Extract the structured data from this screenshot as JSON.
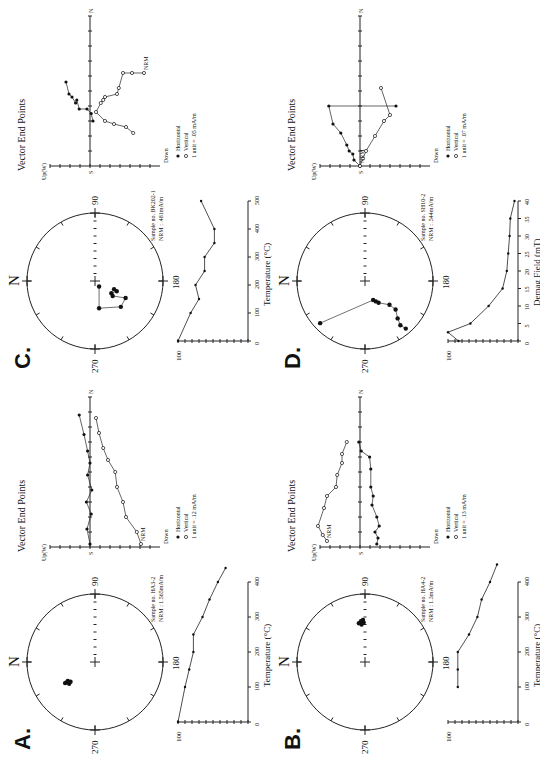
{
  "figure": {
    "orientation": "rotated 90 degrees counter-clockwise",
    "panels": [
      {
        "id": "A",
        "label": "A.",
        "stereonet": {
          "north_label": "N",
          "ticks": [
            "90",
            "180",
            "270"
          ],
          "sample_line1": "Sample no. HA3-2",
          "sample_line2": "NRM : 1.565mA/m",
          "points": [
            [
              -0.3,
              -0.42
            ],
            [
              -0.28,
              -0.4
            ],
            [
              -0.32,
              -0.38
            ],
            [
              -0.29,
              -0.36
            ],
            [
              -0.31,
              -0.44
            ]
          ]
        },
        "zijderveld": {
          "title": "Vector End Points",
          "up_label": "Up(W)",
          "down_label": "Down",
          "s_label": "S",
          "n_label": "N",
          "nrm_label": "NRM",
          "legend_horizontal": "Horizontal",
          "legend_vertical": "Vertical",
          "legend_unit": "1 unit =   .12 mA/m",
          "horizontal": [
            [
              0,
              0.02
            ],
            [
              -0.05,
              0.12
            ],
            [
              0.02,
              0.22
            ],
            [
              -0.06,
              0.3
            ],
            [
              0.03,
              0.38
            ],
            [
              -0.04,
              0.48
            ],
            [
              0,
              0.56
            ],
            [
              -0.04,
              0.64
            ],
            [
              -0.1,
              0.75
            ],
            [
              -0.18,
              0.88
            ]
          ],
          "vertical": [
            [
              0.85,
              0.02
            ],
            [
              0.78,
              0.1
            ],
            [
              0.6,
              0.2
            ],
            [
              0.55,
              0.3
            ],
            [
              0.45,
              0.4
            ],
            [
              0.42,
              0.5
            ],
            [
              0.3,
              0.58
            ],
            [
              0.22,
              0.66
            ],
            [
              0.15,
              0.76
            ],
            [
              0.1,
              0.86
            ]
          ]
        },
        "decay": {
          "xlabel": "Temperature (°C)",
          "ymax_label": "100",
          "xticks": [
            "0",
            "100",
            "200",
            "300",
            "400"
          ],
          "x": [
            0,
            100,
            150,
            200,
            250,
            300,
            350,
            400,
            440
          ],
          "y": [
            1.0,
            0.9,
            0.84,
            0.78,
            0.78,
            0.65,
            0.55,
            0.43,
            0.32
          ]
        }
      },
      {
        "id": "B",
        "label": "B.",
        "stereonet": {
          "north_label": "N",
          "ticks": [
            "90",
            "180",
            "270"
          ],
          "sample_line1": "Sample no. HA4-2",
          "sample_line2": "NRM : 1.3mA/m",
          "points": [
            [
              0.55,
              -0.05
            ],
            [
              0.58,
              -0.02
            ],
            [
              0.6,
              -0.06
            ],
            [
              0.57,
              -0.09
            ],
            [
              0.62,
              -0.03
            ]
          ]
        },
        "zijderveld": {
          "title": "Vector End Points",
          "up_label": "Up(W)",
          "down_label": "Down",
          "s_label": "S",
          "n_label": "N",
          "nrm_label": "NRM",
          "legend_horizontal": "Horizontal",
          "legend_vertical": "Vertical",
          "legend_unit": "1 unit =   .13 mA/m",
          "horizontal": [
            [
              0.28,
              0.02
            ],
            [
              0.3,
              0.06
            ],
            [
              0.25,
              0.1
            ],
            [
              0.32,
              0.14
            ],
            [
              0.28,
              0.2
            ],
            [
              0.2,
              0.28
            ],
            [
              0.22,
              0.34
            ],
            [
              0.18,
              0.4
            ],
            [
              0.18,
              0.52
            ],
            [
              0.16,
              0.6
            ],
            [
              0.02,
              0.64
            ],
            [
              -0.02,
              0.7
            ]
          ],
          "vertical": [
            [
              -0.55,
              0.04
            ],
            [
              -0.62,
              0.08
            ],
            [
              -0.7,
              0.14
            ],
            [
              -0.6,
              0.26
            ],
            [
              -0.55,
              0.34
            ],
            [
              -0.4,
              0.4
            ],
            [
              -0.38,
              0.48
            ],
            [
              -0.3,
              0.56
            ],
            [
              -0.3,
              0.62
            ],
            [
              -0.22,
              0.7
            ]
          ]
        },
        "decay": {
          "xlabel": "Temperature (°C)",
          "ymax_label": "100",
          "xticks": [
            "0",
            "100",
            "200",
            "300",
            "400"
          ],
          "x": [
            100,
            150,
            200,
            250,
            300,
            350,
            400,
            450
          ],
          "y": [
            0.86,
            0.86,
            0.86,
            0.7,
            0.58,
            0.52,
            0.4,
            0.3
          ]
        }
      },
      {
        "id": "C",
        "label": "C.",
        "stereonet": {
          "north_label": "N",
          "ticks": [
            "90",
            "180",
            "270"
          ],
          "sample_line1": "Sample no. BK202-1",
          "sample_line2": "NRM : .481mA/m",
          "points": [
            [
              -0.08,
              0.06
            ],
            [
              -0.4,
              0.06
            ],
            [
              -0.38,
              0.38
            ],
            [
              -0.25,
              0.45
            ],
            [
              -0.22,
              0.26
            ],
            [
              -0.18,
              0.24
            ],
            [
              -0.15,
              0.32
            ],
            [
              -0.12,
              0.28
            ]
          ]
        },
        "zijderveld": {
          "title": "Vector End Points",
          "up_label": "Up(W)",
          "down_label": "Down",
          "s_label": "S",
          "n_label": "N",
          "nrm_label": "NRM",
          "legend_horizontal": "Horizontal",
          "legend_vertical": "Vertical",
          "legend_unit": "1 unit =   .05 mA/m",
          "horizontal": [
            [
              0.05,
              0.3
            ],
            [
              0.02,
              0.35
            ],
            [
              -0.05,
              0.38
            ],
            [
              -0.18,
              0.38
            ],
            [
              -0.22,
              0.44
            ],
            [
              -0.24,
              0.42
            ],
            [
              -0.3,
              0.46
            ],
            [
              -0.35,
              0.48
            ],
            [
              -0.4,
              0.56
            ]
          ],
          "vertical": [
            [
              0.9,
              0.62
            ],
            [
              0.7,
              0.62
            ],
            [
              0.55,
              0.62
            ],
            [
              0.48,
              0.52
            ],
            [
              0.45,
              0.48
            ],
            [
              0.25,
              0.46
            ],
            [
              0.22,
              0.44
            ],
            [
              0.18,
              0.42
            ],
            [
              0.1,
              0.36
            ],
            [
              0.25,
              0.3
            ],
            [
              0.4,
              0.28
            ],
            [
              0.6,
              0.26
            ],
            [
              0.72,
              0.22
            ]
          ]
        },
        "decay": {
          "xlabel": "Temperature (°C)",
          "ymax_label": "100",
          "xticks": [
            "0",
            "100",
            "200",
            "300",
            "400",
            "500"
          ],
          "x": [
            0,
            100,
            150,
            200,
            250,
            300,
            350,
            400,
            500
          ],
          "y": [
            1.0,
            0.82,
            0.7,
            0.75,
            0.62,
            0.62,
            0.48,
            0.48,
            0.67
          ]
        }
      },
      {
        "id": "D",
        "label": "D.",
        "stereonet": {
          "north_label": "N",
          "ticks": [
            "90",
            "180",
            "270"
          ],
          "sample_line1": "Sample no. SH10-2",
          "sample_line2": "NRM : .544mA/m",
          "points": [
            [
              -0.7,
              0.6
            ],
            [
              -0.65,
              0.52
            ],
            [
              -0.55,
              0.48
            ],
            [
              -0.42,
              0.45
            ],
            [
              -0.35,
              0.36
            ],
            [
              -0.32,
              0.2
            ],
            [
              -0.3,
              0.16
            ],
            [
              -0.28,
              0.12
            ],
            [
              -0.62,
              -0.66
            ]
          ]
        },
        "zijderveld": {
          "title": "Vector End Points",
          "up_label": "Up(W)",
          "down_label": "Down",
          "s_label": "S",
          "n_label": "N",
          "nrm_label": "NRM",
          "legend_horizontal": "Horizontal",
          "legend_vertical": "Vertical",
          "legend_unit": "1 unit =   .07 mA/m",
          "horizontal": [
            [
              0,
              0.0
            ],
            [
              -0.1,
              0.04
            ],
            [
              -0.12,
              0.08
            ],
            [
              -0.18,
              0.1
            ],
            [
              -0.22,
              0.14
            ],
            [
              -0.32,
              0.22
            ],
            [
              -0.45,
              0.28
            ],
            [
              -0.52,
              0.4
            ],
            [
              0.6,
              0.4
            ]
          ],
          "vertical": [
            [
              0.0,
              0.0
            ],
            [
              0.05,
              0.05
            ],
            [
              0.1,
              0.1
            ],
            [
              0.25,
              0.2
            ],
            [
              0.4,
              0.3
            ],
            [
              0.5,
              0.34
            ],
            [
              0.35,
              0.52
            ]
          ]
        },
        "decay": {
          "xlabel": "Demag Field (mT)",
          "ymax_label": "100",
          "xticks": [
            "0",
            "5",
            "10",
            "15",
            "20",
            "25",
            "30",
            "35",
            "40"
          ],
          "x": [
            0,
            2.5,
            5,
            10,
            15,
            20,
            25,
            30,
            35,
            40
          ],
          "y": [
            0.85,
            1.0,
            0.68,
            0.42,
            0.22,
            0.16,
            0.14,
            0.12,
            0.11,
            0.05
          ]
        }
      }
    ]
  }
}
